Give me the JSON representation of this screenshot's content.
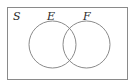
{
  "diagram": {
    "type": "venn",
    "universe_label": "S",
    "sets": [
      {
        "label": "E"
      },
      {
        "label": "F"
      }
    ],
    "colors": {
      "stroke": "#8a8a8a",
      "text": "#2a2a2a",
      "background": "#ffffff"
    }
  }
}
